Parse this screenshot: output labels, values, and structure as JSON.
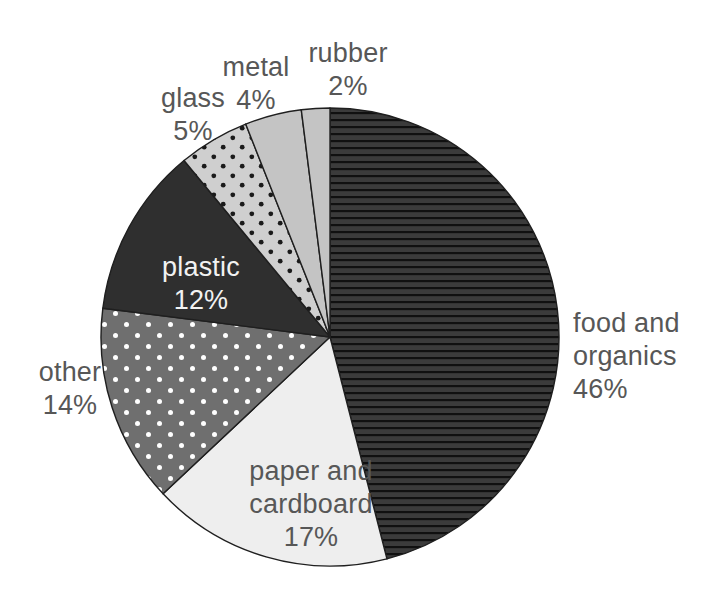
{
  "chart_data": {
    "type": "pie",
    "title": "",
    "subtitle": "",
    "xlabel": "",
    "ylabel": "",
    "legend_position": "none",
    "grid": false,
    "start_angle_deg": 0,
    "direction": "clockwise",
    "units": "percent",
    "categories": [
      "food and organics",
      "paper and cardboard",
      "other",
      "plastic",
      "glass",
      "metal",
      "rubber"
    ],
    "values": [
      46,
      17,
      14,
      12,
      5,
      4,
      2
    ],
    "slices": [
      {
        "name": "food and organics",
        "label_line1": "food and",
        "label_line2": "organics",
        "value": 46,
        "value_label": "46%",
        "fill": "#3b3b3b",
        "pattern": "horizontal-lines",
        "pattern_color": "#111111",
        "label_color": "#575757",
        "label_placement": "outside-right"
      },
      {
        "name": "paper and cardboard",
        "label_line1": "paper and",
        "label_line2": "cardboard",
        "value": 17,
        "value_label": "17%",
        "fill": "#eeeeee",
        "pattern": "solid",
        "pattern_color": "#eeeeee",
        "label_color": "#575757",
        "label_placement": "inside"
      },
      {
        "name": "other",
        "label_line1": "other",
        "label_line2": "",
        "value": 14,
        "value_label": "14%",
        "fill": "#6f6f6f",
        "pattern": "white-dots",
        "pattern_color": "#ffffff",
        "label_color": "#575757",
        "label_placement": "outside-left"
      },
      {
        "name": "plastic",
        "label_line1": "plastic",
        "label_line2": "",
        "value": 12,
        "value_label": "12%",
        "fill": "#2f2f2f",
        "pattern": "solid",
        "pattern_color": "#2f2f2f",
        "label_color": "#f2f2f2",
        "label_placement": "inside"
      },
      {
        "name": "glass",
        "label_line1": "glass",
        "label_line2": "",
        "value": 5,
        "value_label": "5%",
        "fill": "#cfcfcf",
        "pattern": "black-dots",
        "pattern_color": "#1a1a1a",
        "label_color": "#575757",
        "label_placement": "outside-top"
      },
      {
        "name": "metal",
        "label_line1": "metal",
        "label_line2": "",
        "value": 4,
        "value_label": "4%",
        "fill": "#c4c4c4",
        "pattern": "solid",
        "pattern_color": "#c4c4c4",
        "label_color": "#575757",
        "label_placement": "outside-top"
      },
      {
        "name": "rubber",
        "label_line1": "rubber",
        "label_line2": "",
        "value": 2,
        "value_label": "2%",
        "fill": "#c4c4c4",
        "pattern": "solid",
        "pattern_color": "#c4c4c4",
        "label_color": "#575757",
        "label_placement": "outside-top"
      }
    ],
    "geometry": {
      "center_x": 330,
      "center_y": 337,
      "radius": 229,
      "stroke": "#1f1f1f",
      "stroke_width": 1.4
    },
    "background": "#ffffff"
  }
}
